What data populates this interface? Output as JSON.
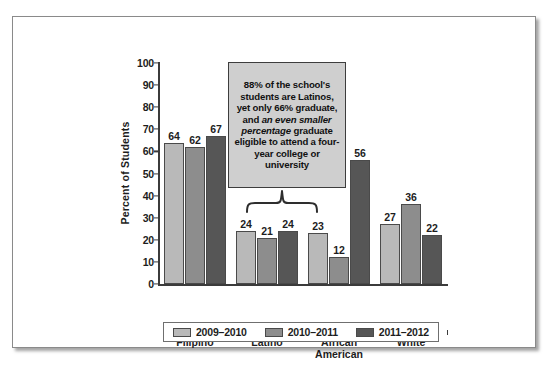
{
  "chart_data": {
    "type": "bar",
    "title": "",
    "xlabel": "",
    "ylabel": "Percent of Students",
    "ylim": [
      0,
      100
    ],
    "yticks": [
      0,
      10,
      20,
      30,
      40,
      50,
      60,
      70,
      80,
      90,
      100
    ],
    "grid": false,
    "legend_position": "bottom",
    "categories": [
      "Filipino",
      "Latino",
      "African\nAmerican",
      "White"
    ],
    "series": [
      {
        "name": "2009–2010",
        "color": "#b9b9b9",
        "values": [
          64,
          24,
          23,
          27
        ]
      },
      {
        "name": "2010–2011",
        "color": "#8d8d8d",
        "values": [
          62,
          21,
          12,
          36
        ]
      },
      {
        "name": "2011–2012",
        "color": "#565656",
        "values": [
          67,
          24,
          56,
          22
        ]
      }
    ],
    "annotations": [
      {
        "id": "latino-callout",
        "target_category": "Latino",
        "text_parts": [
          {
            "text": "88% of the school's students are Latinos, yet only 66% graduate, and ",
            "style": "normal"
          },
          {
            "text": "an even smaller percentage",
            "style": "italic"
          },
          {
            "text": " graduate eligible to attend a four-year college or university",
            "style": "normal"
          }
        ]
      }
    ]
  },
  "icons": {
    "brace": "curly-brace-icon"
  }
}
